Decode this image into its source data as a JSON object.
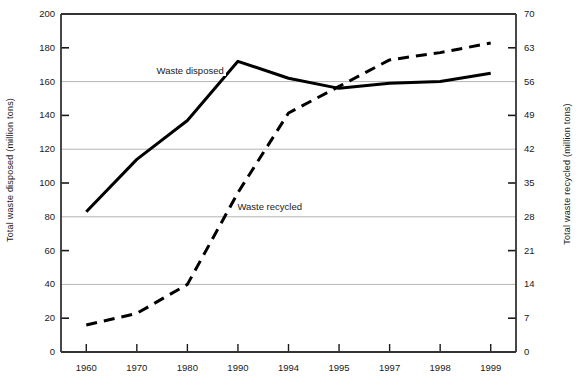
{
  "chart_data": {
    "type": "line",
    "title": "",
    "xlabel": "",
    "ylabel": "Total waste disposed (million tons)",
    "ylabel_right": "Total waste recycled (million tons)",
    "categories": [
      "1960",
      "1970",
      "1980",
      "1990",
      "1994",
      "1995",
      "1997",
      "1998",
      "1999"
    ],
    "ylim": [
      0,
      200
    ],
    "yticks": [
      0,
      20,
      40,
      60,
      80,
      100,
      120,
      140,
      160,
      180,
      200
    ],
    "gridlines_left": [
      40,
      80,
      120,
      160
    ],
    "ylim_right": [
      0,
      70
    ],
    "yticks_right": [
      0,
      7,
      14,
      21,
      28,
      35,
      42,
      49,
      56,
      63,
      70
    ],
    "grid": true,
    "legend": "inline-labels",
    "series": [
      {
        "name": "Waste disposed",
        "axis": "left",
        "style": "solid",
        "color": "#000000",
        "values": [
          83,
          114,
          137,
          172,
          162,
          156,
          159,
          160,
          165
        ]
      },
      {
        "name": "Waste recycled",
        "axis": "right",
        "style": "dashed",
        "color": "#000000",
        "values": [
          5.6,
          8.0,
          14.0,
          33.0,
          49.5,
          55.0,
          60.5,
          62.0,
          64.0
        ]
      }
    ],
    "annotations": [
      {
        "text": "Waste disposed",
        "x": 1.35,
        "y_left": 166
      },
      {
        "text": "Waste recycled",
        "x": 2.95,
        "y_left": 86
      }
    ]
  }
}
